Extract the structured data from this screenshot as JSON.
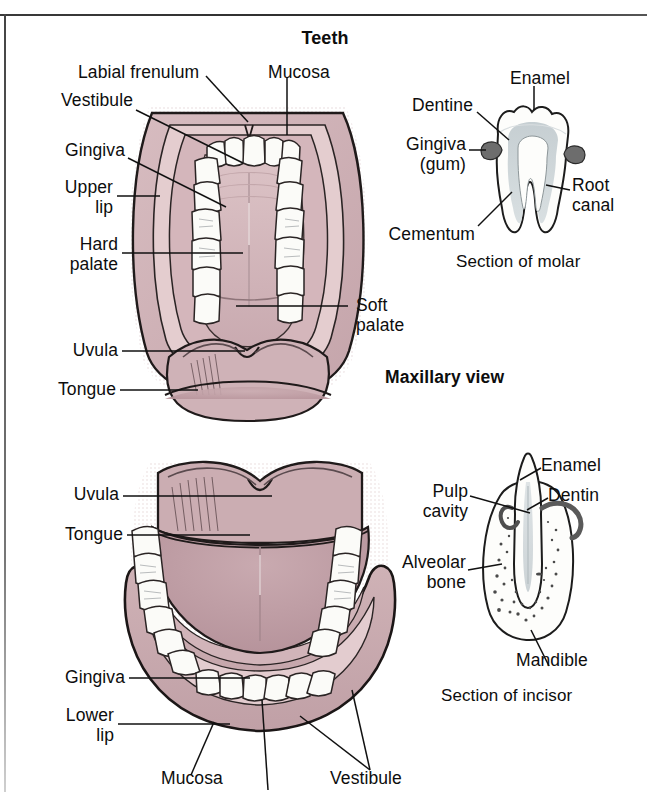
{
  "page": {
    "title": "Teeth",
    "background_color": "#ffffff",
    "ink_color": "#1a1a1a"
  },
  "palette": {
    "mucosa_pink": "#cdb0b4",
    "mucosa_pink_dark": "#bd9ca2",
    "tongue_pink": "#c3a3a9",
    "lip_pink": "#d2b6ba",
    "palate_pink": "#d8bfc2",
    "tooth_white": "#fdfdfb",
    "dentine_gray": "#c9d0d3",
    "gingiva_gray": "#6e6e6e",
    "bone_stipple": "#4a4a4a"
  },
  "figures": {
    "maxillary": {
      "caption": "Maxillary view",
      "labels": [
        {
          "id": "labial-frenulum",
          "text": "Labial frenulum"
        },
        {
          "id": "mucosa",
          "text": "Mucosa"
        },
        {
          "id": "vestibule",
          "text": "Vestibule"
        },
        {
          "id": "gingiva",
          "text": "Gingiva"
        },
        {
          "id": "upper-lip",
          "text": "Upper\nlip"
        },
        {
          "id": "hard-palate",
          "text": "Hard\npalate"
        },
        {
          "id": "soft-palate",
          "text": "Soft\npalate"
        },
        {
          "id": "uvula",
          "text": "Uvula"
        },
        {
          "id": "tongue",
          "text": "Tongue"
        }
      ]
    },
    "mandibular": {
      "caption": "",
      "labels": [
        {
          "id": "uvula",
          "text": "Uvula"
        },
        {
          "id": "tongue",
          "text": "Tongue"
        },
        {
          "id": "gingiva",
          "text": "Gingiva"
        },
        {
          "id": "lower-lip",
          "text": "Lower\nlip"
        },
        {
          "id": "mucosa",
          "text": "Mucosa"
        },
        {
          "id": "vestibule",
          "text": "Vestibule"
        }
      ]
    },
    "molar": {
      "caption": "Section of molar",
      "labels": [
        {
          "id": "enamel",
          "text": "Enamel"
        },
        {
          "id": "dentine",
          "text": "Dentine"
        },
        {
          "id": "gingiva-gum",
          "text": "Gingiva\n(gum)"
        },
        {
          "id": "cementum",
          "text": "Cementum"
        },
        {
          "id": "root-canal",
          "text": "Root\ncanal"
        }
      ]
    },
    "incisor": {
      "caption": "Section of incisor",
      "labels": [
        {
          "id": "enamel",
          "text": "Enamel"
        },
        {
          "id": "dentin",
          "text": "Dentin"
        },
        {
          "id": "pulp-cavity",
          "text": "Pulp\ncavity"
        },
        {
          "id": "alveolar-bone",
          "text": "Alveolar\nbone"
        },
        {
          "id": "mandible",
          "text": "Mandible"
        }
      ]
    }
  }
}
